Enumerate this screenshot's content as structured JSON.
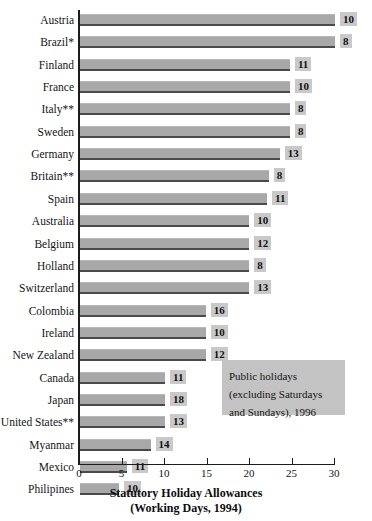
{
  "chart_data": {
    "type": "bar",
    "orientation": "horizontal",
    "title": "Statutory Holiday Allowances",
    "subtitle": "(Working Days, 1994)",
    "xlabel": "Statutory Holiday Allowances (Working Days, 1994)",
    "ylabel": "",
    "xlim": [
      0,
      30
    ],
    "xticks": [
      0,
      5,
      10,
      15,
      20,
      25,
      30
    ],
    "xtick_labels": [
      "0",
      "5",
      "10",
      "15",
      "20",
      "25",
      "30"
    ],
    "grid": false,
    "legend_position": "inside-lower-right",
    "categories": [
      "Austria",
      "Brazil*",
      "Finland",
      "France",
      "Italy**",
      "Sweden",
      "Germany",
      "Britain**",
      "Spain",
      "Australia",
      "Belgium",
      "Holland",
      "Switzerland",
      "Colombia",
      "Ireland",
      "New Zealand",
      "Canada",
      "Japan",
      "United States**",
      "Myanmar",
      "Mexico",
      "Philipines"
    ],
    "series": [
      {
        "name": "Statutory Holiday Allowances (Working Days, 1994)",
        "values": [
          30,
          30,
          24.7,
          24.7,
          24.7,
          24.7,
          23.5,
          22.2,
          22.0,
          19.9,
          19.9,
          19.9,
          19.9,
          14.8,
          14.8,
          14.8,
          10,
          10,
          10,
          8.3,
          5.5,
          4.6
        ]
      },
      {
        "name": "Public holidays (excluding Saturdays and Sundays), 1996",
        "values": [
          10,
          8,
          11,
          10,
          8,
          8,
          13,
          8,
          11,
          10,
          12,
          8,
          13,
          16,
          10,
          12,
          11,
          18,
          13,
          14,
          11,
          10
        ]
      }
    ],
    "annotations": [
      "Public holidays",
      "(excluding Saturdays",
      "and Sundays), 1996"
    ]
  },
  "legend": {
    "line1": "Public holidays",
    "line2": "(excluding Saturdays",
    "line3": "and Sundays), 1996"
  },
  "axis_title": {
    "line1": "Statutory Holiday Allowances",
    "line2": "(Working Days, 1994)"
  },
  "colors": {
    "bar_fill": "#a8a8a8",
    "bar_shadow": "#4a4a4a",
    "value_label_bg": "#c9c9c9",
    "legend_bg": "#c3c3c3",
    "axis": "#1c1c1c",
    "text": "#141414",
    "background": "#ffffff"
  }
}
